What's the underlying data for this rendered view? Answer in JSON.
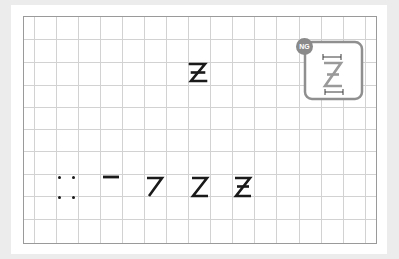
{
  "worksheet": {
    "character": "Z",
    "variant": "crossed-z",
    "grid": {
      "left": 23,
      "top": 16,
      "right": 377,
      "bottom": 244,
      "v_lines": [
        34,
        56,
        78,
        100,
        122,
        144,
        166,
        188,
        210,
        232,
        254,
        276,
        299,
        321,
        343,
        365
      ],
      "h_lines": [
        39,
        62,
        85,
        107,
        129,
        151,
        174,
        196,
        219
      ],
      "line_color": "#cfcfcf",
      "border_color": "#9a9a9a"
    },
    "ng_example": {
      "badge_label": "NG",
      "badge_color": "#8a8a8a",
      "frame_color": "#8f8f8f",
      "description": "incorrect: crossed Z drawn too tall/narrow"
    },
    "model_glyph": {
      "description": "crossed Z model character"
    },
    "stroke_order": [
      {
        "step": 1,
        "name": "start-points"
      },
      {
        "step": 2,
        "name": "top-stroke"
      },
      {
        "step": 3,
        "name": "top-and-diagonal"
      },
      {
        "step": 4,
        "name": "full-z"
      },
      {
        "step": 5,
        "name": "z-with-crossbar"
      }
    ],
    "colors": {
      "ink": "#1a1a1a",
      "page_bg": "#ececec",
      "card_bg": "#ffffff"
    }
  }
}
